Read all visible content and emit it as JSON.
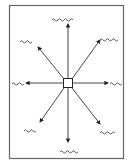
{
  "diagram": {
    "center": {
      "shape": "square",
      "label": ""
    },
    "stroke_color": "#333333",
    "frame_color": "#555555",
    "background": "#ffffff",
    "branches": [
      {
        "direction": "N",
        "label": "[illegible scribble]",
        "scribble_glyphs": "~~ ~~~"
      },
      {
        "direction": "NE",
        "label": "[illegible scribble]",
        "scribble_glyphs": "~~~d"
      },
      {
        "direction": "E",
        "label": "[illegible scribble]",
        "scribble_glyphs": "~~"
      },
      {
        "direction": "SE",
        "label": "[illegible scribble]",
        "scribble_glyphs": "~~~"
      },
      {
        "direction": "S",
        "label": "[illegible scribble]",
        "scribble_glyphs": "~~ ~"
      },
      {
        "direction": "SW",
        "label": "[illegible scribble]",
        "scribble_glyphs": "3v"
      },
      {
        "direction": "W",
        "label": "[illegible scribble]",
        "scribble_glyphs": "~~"
      },
      {
        "direction": "NW",
        "label": "[illegible scribble]",
        "scribble_glyphs": "~~"
      }
    ]
  }
}
